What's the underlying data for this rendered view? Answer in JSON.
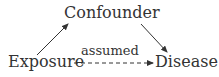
{
  "diagram": {
    "nodes": [
      {
        "id": "confounder",
        "label": "Confounder"
      },
      {
        "id": "exposure",
        "label": "Exposure"
      },
      {
        "id": "disease",
        "label": "Disease"
      }
    ],
    "edges": [
      {
        "from": "exposure",
        "to": "confounder",
        "style": "solid",
        "label": ""
      },
      {
        "from": "confounder",
        "to": "disease",
        "style": "solid",
        "label": ""
      },
      {
        "from": "exposure",
        "to": "disease",
        "style": "dashed",
        "label": "assumed"
      }
    ],
    "colors": {
      "text": "#333333",
      "line": "#333333",
      "background": "#ffffff"
    }
  }
}
